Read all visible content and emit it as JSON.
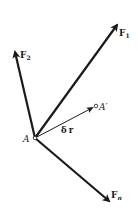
{
  "diagram": {
    "origin": {
      "label": "A",
      "x": 35,
      "y": 138
    },
    "displaced_point": {
      "label": "A′",
      "x": 96,
      "y": 107
    },
    "displacement": {
      "label_delta": "δ",
      "label_vec": "r"
    },
    "forces": [
      {
        "name": "F",
        "sub": "1",
        "tip_x": 119,
        "tip_y": 22
      },
      {
        "name": "F",
        "sub": "2",
        "tip_x": 14,
        "tip_y": 49
      },
      {
        "name": "F",
        "sub": "n",
        "tip_x": 111,
        "tip_y": 203
      }
    ],
    "colors": {
      "ink": "#1a1a1a",
      "background": "#ffffff"
    }
  }
}
